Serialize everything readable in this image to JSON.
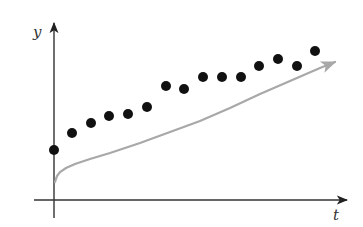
{
  "chart_data": {
    "type": "scatter",
    "title": "",
    "xlabel": "t",
    "ylabel": "y",
    "grid": false,
    "legend": null,
    "series": [
      {
        "name": "data points",
        "kind": "scatter",
        "color": "#111111",
        "points_px": [
          [
            54,
            150
          ],
          [
            72,
            133
          ],
          [
            91,
            123
          ],
          [
            109,
            116
          ],
          [
            128,
            114
          ],
          [
            147,
            107
          ],
          [
            166,
            86
          ],
          [
            184,
            89
          ],
          [
            203,
            77
          ],
          [
            222,
            77
          ],
          [
            241,
            77
          ],
          [
            259,
            66
          ],
          [
            278,
            59
          ],
          [
            297,
            66
          ],
          [
            315,
            51
          ]
        ]
      },
      {
        "name": "trend curve",
        "kind": "line",
        "color": "#a8a8a8",
        "shape": "square-root-like increasing curve with arrowhead",
        "points_px": [
          [
            55,
            182
          ],
          [
            57,
            176
          ],
          [
            60,
            172
          ],
          [
            66,
            168
          ],
          [
            75,
            164
          ],
          [
            90,
            159
          ],
          [
            110,
            153
          ],
          [
            140,
            143
          ],
          [
            170,
            132
          ],
          [
            200,
            121
          ],
          [
            230,
            108
          ],
          [
            260,
            94
          ],
          [
            290,
            81
          ],
          [
            320,
            68
          ],
          [
            335,
            62
          ]
        ]
      }
    ],
    "axes": {
      "origin_px": [
        54,
        200
      ],
      "x_end_px": [
        347,
        200
      ],
      "y_end_px": [
        54,
        23
      ]
    }
  }
}
